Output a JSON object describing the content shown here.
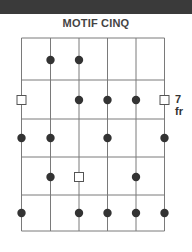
{
  "banner": {
    "color": "#3a3a3a"
  },
  "title": "MOTIF CINQ",
  "fret_label": "7 fr",
  "diagram": {
    "strings_x": [
      21.5,
      50.5,
      79,
      107.5,
      136,
      164.5
    ],
    "frets_y": [
      38,
      80,
      119,
      157,
      195,
      231
    ],
    "line_color": "#7a7a7a",
    "dot_color": "#333333",
    "dots": [
      {
        "row": 0,
        "string": 1
      },
      {
        "row": 0,
        "string": 2
      },
      {
        "row": 1,
        "string": 2
      },
      {
        "row": 1,
        "string": 3
      },
      {
        "row": 1,
        "string": 4
      },
      {
        "row": 2,
        "string": 0
      },
      {
        "row": 2,
        "string": 1
      },
      {
        "row": 2,
        "string": 3
      },
      {
        "row": 2,
        "string": 5
      },
      {
        "row": 3,
        "string": 1
      },
      {
        "row": 3,
        "string": 4
      },
      {
        "row": 4,
        "string": 0
      },
      {
        "row": 4,
        "string": 2
      },
      {
        "row": 4,
        "string": 3
      },
      {
        "row": 4,
        "string": 4
      },
      {
        "row": 4,
        "string": 5
      }
    ],
    "boxes": [
      {
        "row": 1,
        "string": 0
      },
      {
        "row": 1,
        "string": 5
      },
      {
        "row": 3,
        "string": 2
      }
    ],
    "row_centers_y": [
      60,
      100,
      138,
      177,
      213
    ]
  }
}
